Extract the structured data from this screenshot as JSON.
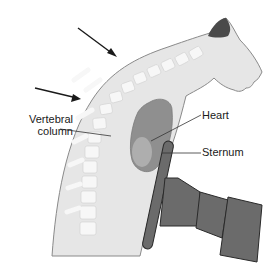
{
  "diagram": {
    "labels": {
      "vertebral_column_line1": "Vertebral",
      "vertebral_column_line2": "column",
      "heart": "Heart",
      "sternum": "Sternum"
    },
    "arrows": [
      {
        "name": "upper-back-arrow",
        "from": [
          78,
          28
        ],
        "to": [
          117,
          57
        ]
      },
      {
        "name": "lower-back-arrow",
        "from": [
          35,
          88
        ],
        "to": [
          81,
          99
        ]
      }
    ],
    "colors": {
      "body_fill": "#e6e6e6",
      "body_outline": "#8a8a8a",
      "vertebrae": "#f7f7f7",
      "heart": "#8f8f8f",
      "heart_highlight": "#b5b5b5",
      "device": "#6b6b6b",
      "device_outline": "#2a2a2a",
      "arrow": "#1a1a1a",
      "text": "#1a1a1a"
    }
  }
}
